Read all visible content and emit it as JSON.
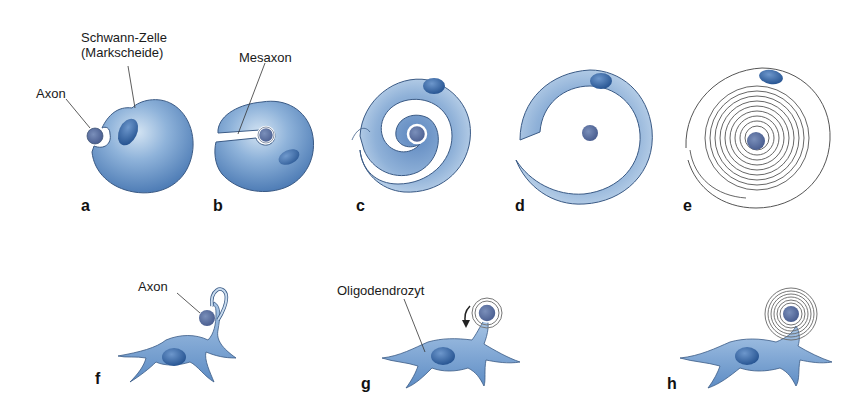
{
  "figure": {
    "type": "myelination-diagram",
    "colors": {
      "cell_fill_light": "#c9dcef",
      "cell_fill": "#7ea6d2",
      "cell_fill_dark": "#4a79b3",
      "nucleus": "#2f5f9f",
      "axon": "#5a6f9e",
      "outline": "#3a4f70",
      "spiral_line": "#555555",
      "label_text": "#1a1a1a"
    },
    "top_row": {
      "panels": [
        {
          "id": "a",
          "label": "a"
        },
        {
          "id": "b",
          "label": "b"
        },
        {
          "id": "c",
          "label": "c"
        },
        {
          "id": "d",
          "label": "d"
        },
        {
          "id": "e",
          "label": "e"
        }
      ],
      "annotations": {
        "axon": "Axon",
        "schwann_line1": "Schwann-Zelle",
        "schwann_line2": "(Markscheide)",
        "mesaxon": "Mesaxon"
      }
    },
    "bottom_row": {
      "panels": [
        {
          "id": "f",
          "label": "f"
        },
        {
          "id": "g",
          "label": "g"
        },
        {
          "id": "h",
          "label": "h"
        }
      ],
      "annotations": {
        "axon": "Axon",
        "oligodendrocyte": "Oligodendrozyt"
      }
    }
  }
}
